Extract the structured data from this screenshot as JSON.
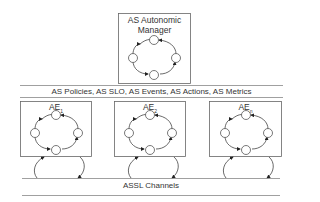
{
  "manager": {
    "title_line1": "AS Autonomic",
    "title_line2": "Manager"
  },
  "tier_bar": {
    "label": "AS Policies, AS SLO, AS Events, AS Actions, AS Metrics"
  },
  "elements": [
    {
      "label": "AE",
      "sub": "1"
    },
    {
      "label": "AE",
      "sub": "2"
    },
    {
      "label": "AE",
      "sub": "n"
    }
  ],
  "channels": {
    "label": "ASSL Channels"
  },
  "colors": {
    "stroke": "#444444",
    "line": "#888888"
  }
}
